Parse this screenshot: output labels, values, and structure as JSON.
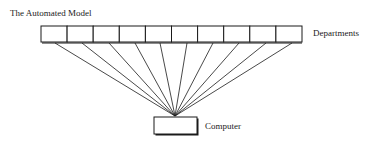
{
  "title": "The Automated Model",
  "labels": {
    "departments": "Departments",
    "computer": "Computer"
  },
  "diagram": {
    "department_count": 10,
    "strip": {
      "x": 41,
      "y": 26,
      "width": 261,
      "height": 16
    },
    "computer_box": {
      "x": 154,
      "y": 117,
      "width": 43,
      "height": 17
    },
    "hub": {
      "x": 175,
      "y": 116
    },
    "line_starts_x": [
      55,
      82,
      109,
      135,
      160,
      187,
      213,
      239,
      266,
      292
    ],
    "line_start_y": 43,
    "stroke": "#1a1a1a"
  }
}
